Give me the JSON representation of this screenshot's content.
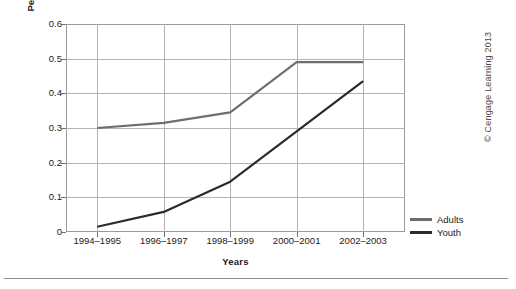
{
  "chart_data": {
    "type": "line",
    "title": "",
    "xlabel": "Years",
    "ylabel": "Percentage of office visits for bipolar disorder",
    "categories": [
      "1994–1995",
      "1996–1997",
      "1998–1999",
      "2000–2001",
      "2002–2003"
    ],
    "ylim": [
      0,
      0.6
    ],
    "yticks": [
      "0",
      "0.1",
      "0.2",
      "0.3",
      "0.4",
      "0.5",
      "0.6"
    ],
    "ytick_values": [
      0,
      0.1,
      0.2,
      0.3,
      0.4,
      0.5,
      0.6
    ],
    "grid": "both",
    "legend_position": "right",
    "series": [
      {
        "name": "Adults",
        "color": "#6e6e6e",
        "values": [
          0.3,
          0.315,
          0.345,
          0.49,
          0.49
        ]
      },
      {
        "name": "Youth",
        "color": "#2b2b2b",
        "values": [
          0.015,
          0.058,
          0.145,
          0.29,
          0.435
        ]
      }
    ]
  },
  "legend": {
    "items": [
      {
        "label": "Adults",
        "color": "#6e6e6e"
      },
      {
        "label": "Youth",
        "color": "#2b2b2b"
      }
    ]
  },
  "credit": {
    "text": "© Cengage Learning 2013"
  },
  "colors": {
    "adults": "#6e6e6e",
    "youth": "#2b2b2b",
    "grid": "#b3b3b3",
    "frame": "#9a9a9a",
    "text": "#1b1b1b"
  }
}
